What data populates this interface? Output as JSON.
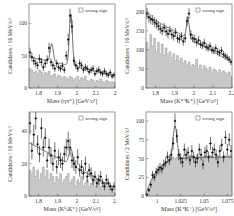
{
  "figure": {
    "legend_label": "wrong sign",
    "hist_color": "#c8c8c8",
    "hist_edge_color": "#8a8a8a",
    "point_color": "#111111",
    "fit_color": "#333333"
  },
  "chart_data": [
    {
      "type": "bar",
      "panel": "top-left",
      "title": "",
      "xlabel": "Mass (ηπ⁺)  [GeV/c²]",
      "ylabel": "Candidates / 10 MeV/c²",
      "xlim": [
        1.75,
        2.2
      ],
      "ylim": [
        0,
        130
      ],
      "xticks": [
        1.8,
        1.9,
        2.0,
        2.1,
        2.2
      ],
      "xtick_labels": [
        "1.8",
        "1.9",
        "2",
        "2.1",
        "2"
      ],
      "yticks": [
        0,
        50,
        100
      ],
      "legend": [
        "wrong sign"
      ],
      "legend_position": "upper right",
      "grid": false,
      "x": [
        1.755,
        1.765,
        1.775,
        1.785,
        1.795,
        1.805,
        1.815,
        1.825,
        1.835,
        1.845,
        1.855,
        1.865,
        1.875,
        1.885,
        1.895,
        1.905,
        1.915,
        1.925,
        1.935,
        1.945,
        1.955,
        1.965,
        1.975,
        1.985,
        1.995,
        2.005,
        2.015,
        2.025,
        2.035,
        2.045,
        2.055,
        2.065,
        2.075,
        2.085,
        2.095,
        2.105,
        2.115,
        2.125,
        2.135,
        2.145,
        2.155,
        2.165,
        2.175,
        2.185,
        2.195
      ],
      "series": [
        {
          "name": "data",
          "values": [
            55,
            48,
            42,
            38,
            35,
            45,
            40,
            32,
            38,
            44,
            62,
            40,
            35,
            30,
            38,
            32,
            30,
            34,
            28,
            50,
            75,
            112,
            95,
            42,
            35,
            30,
            38,
            35,
            28,
            32,
            30,
            25,
            28,
            30,
            22,
            26,
            28,
            24,
            22,
            26,
            22,
            20,
            24,
            18,
            20
          ]
        },
        {
          "name": "wrong sign",
          "values": [
            30,
            28,
            24,
            26,
            22,
            28,
            25,
            20,
            24,
            22,
            26,
            18,
            20,
            22,
            16,
            20,
            18,
            15,
            18,
            16,
            14,
            18,
            16,
            12,
            15,
            18,
            12,
            16,
            14,
            18,
            12,
            10,
            14,
            12,
            8,
            12,
            10,
            14,
            10,
            8,
            12,
            10,
            8,
            10,
            8
          ]
        }
      ],
      "fit": {
        "peaks": [
          {
            "x": 1.869,
            "height": 28,
            "sigma": 0.008
          },
          {
            "x": 1.969,
            "height": 80,
            "sigma": 0.008
          }
        ],
        "bg_start": 48,
        "bg_end": 20
      }
    },
    {
      "type": "bar",
      "panel": "top-right",
      "title": "",
      "xlabel": "Mass (K*⁰K⁺)  [GeV/c²]",
      "ylabel": "Candidates / 10 MeV/c²",
      "xlim": [
        1.75,
        2.2
      ],
      "ylim": [
        0,
        220
      ],
      "xticks": [
        1.8,
        1.9,
        2.0,
        2.1,
        2.2
      ],
      "xtick_labels": [
        "1.8",
        "1.9",
        "2",
        "2.1",
        "2.2"
      ],
      "yticks": [
        0,
        50,
        100,
        150,
        200
      ],
      "legend": [
        "wrong sign"
      ],
      "legend_position": "upper right",
      "grid": false,
      "x": [
        1.755,
        1.765,
        1.775,
        1.785,
        1.795,
        1.805,
        1.815,
        1.825,
        1.835,
        1.845,
        1.855,
        1.865,
        1.875,
        1.885,
        1.895,
        1.905,
        1.915,
        1.925,
        1.935,
        1.945,
        1.955,
        1.965,
        1.975,
        1.985,
        1.995,
        2.005,
        2.015,
        2.025,
        2.035,
        2.045,
        2.055,
        2.065,
        2.075,
        2.085,
        2.095,
        2.105,
        2.115,
        2.125,
        2.135,
        2.145,
        2.155,
        2.165,
        2.175,
        2.185,
        2.195
      ],
      "series": [
        {
          "name": "data",
          "values": [
            195,
            185,
            180,
            178,
            172,
            168,
            162,
            155,
            150,
            158,
            148,
            142,
            150,
            140,
            136,
            145,
            130,
            128,
            135,
            122,
            130,
            175,
            195,
            140,
            130,
            128,
            120,
            125,
            115,
            112,
            118,
            108,
            105,
            110,
            100,
            98,
            104,
            95,
            92,
            98,
            88,
            84,
            80,
            75,
            68
          ]
        },
        {
          "name": "wrong sign",
          "values": [
            120,
            100,
            140,
            110,
            130,
            95,
            120,
            90,
            115,
            85,
            105,
            88,
            95,
            80,
            90,
            72,
            85,
            70,
            78,
            65,
            72,
            60,
            68,
            55,
            62,
            58,
            75,
            50,
            60,
            48,
            58,
            52,
            45,
            55,
            42,
            50,
            46,
            40,
            48,
            38,
            45,
            40,
            35,
            42,
            30
          ]
        }
      ],
      "fit": {
        "peaks": [
          {
            "x": 1.969,
            "height": 55,
            "sigma": 0.007
          }
        ],
        "bg_start": 190,
        "bg_end": 68
      }
    },
    {
      "type": "bar",
      "panel": "bottom-left",
      "title": "",
      "xlabel": "Mass (K⁰ₛK⁺)  [GeV/c²]",
      "ylabel": "Candidates / 10 MeV/c²",
      "xlim": [
        1.75,
        2.2
      ],
      "ylim": [
        0,
        52
      ],
      "xticks": [
        1.8,
        1.9,
        2.0,
        2.1,
        2.2
      ],
      "xtick_labels": [
        "1.8",
        "1.9",
        "2",
        "2.1",
        "2."
      ],
      "yticks": [
        0,
        20,
        40
      ],
      "legend": [
        "wrong sign"
      ],
      "legend_position": "upper right",
      "grid": false,
      "x": [
        1.755,
        1.765,
        1.775,
        1.785,
        1.795,
        1.805,
        1.815,
        1.825,
        1.835,
        1.845,
        1.855,
        1.865,
        1.875,
        1.885,
        1.895,
        1.905,
        1.915,
        1.925,
        1.935,
        1.945,
        1.955,
        1.965,
        1.975,
        1.985,
        1.995,
        2.005,
        2.015,
        2.025,
        2.035,
        2.045,
        2.055,
        2.065,
        2.075,
        2.085,
        2.095,
        2.105,
        2.115,
        2.125,
        2.135,
        2.145,
        2.155,
        2.165,
        2.175,
        2.185,
        2.195
      ],
      "series": [
        {
          "name": "data",
          "values": [
            45,
            28,
            38,
            48,
            32,
            26,
            42,
            30,
            36,
            22,
            30,
            25,
            20,
            28,
            18,
            24,
            22,
            20,
            26,
            30,
            34,
            30,
            22,
            20,
            18,
            24,
            16,
            18,
            14,
            20,
            12,
            16,
            14,
            10,
            12,
            8,
            10,
            12,
            8,
            6,
            10,
            8,
            6,
            4,
            6
          ]
        },
        {
          "name": "wrong sign",
          "values": [
            16,
            14,
            18,
            12,
            16,
            10,
            14,
            18,
            12,
            16,
            10,
            14,
            12,
            8,
            12,
            10,
            14,
            8,
            10,
            12,
            14,
            8,
            10,
            12,
            6,
            10,
            8,
            12,
            6,
            8,
            10,
            6,
            8,
            10,
            6,
            8,
            10,
            6,
            4,
            8,
            6,
            4,
            6,
            4,
            2
          ]
        }
      ],
      "fit": {
        "peaks": [
          {
            "x": 1.969,
            "height": 10,
            "sigma": 0.01
          }
        ],
        "bg_start": 33,
        "bg_end": 5
      }
    },
    {
      "type": "bar",
      "panel": "bottom-right",
      "title": "",
      "xlabel": "Mass (K⁺K⁻)  [GeV/c²]",
      "ylabel": "Candidates / 2 MeV/c²",
      "xlim": [
        0.988,
        1.08
      ],
      "ylim": [
        0,
        112
      ],
      "xticks": [
        1.0,
        1.025,
        1.05,
        1.075
      ],
      "xtick_labels": [
        "1",
        "1.025",
        "1.05",
        "1.075"
      ],
      "yticks": [
        0,
        25,
        50,
        75,
        100
      ],
      "legend": [
        "wrong sign"
      ],
      "legend_position": "upper right",
      "grid": false,
      "x": [
        0.989,
        0.991,
        0.993,
        0.995,
        0.997,
        0.999,
        1.001,
        1.003,
        1.005,
        1.007,
        1.009,
        1.011,
        1.013,
        1.015,
        1.017,
        1.019,
        1.021,
        1.023,
        1.025,
        1.027,
        1.029,
        1.031,
        1.033,
        1.035,
        1.037,
        1.039,
        1.041,
        1.043,
        1.045,
        1.047,
        1.049,
        1.051,
        1.053,
        1.055,
        1.057,
        1.059,
        1.061,
        1.063,
        1.065,
        1.067,
        1.069,
        1.071,
        1.073,
        1.075,
        1.077,
        1.079
      ],
      "series": [
        {
          "name": "data",
          "values": [
            2,
            8,
            15,
            28,
            25,
            32,
            35,
            38,
            36,
            42,
            45,
            52,
            48,
            55,
            70,
            100,
            80,
            55,
            50,
            45,
            62,
            55,
            58,
            48,
            60,
            52,
            45,
            50,
            62,
            55,
            42,
            58,
            60,
            52,
            70,
            58,
            62,
            55,
            45,
            60,
            68,
            52,
            78,
            62,
            75,
            60
          ]
        },
        {
          "name": "wrong sign",
          "values": [
            2,
            6,
            12,
            22,
            26,
            30,
            32,
            36,
            38,
            42,
            44,
            46,
            48,
            50,
            52,
            50,
            52,
            54,
            52,
            50,
            54,
            52,
            50,
            52,
            54,
            52,
            50,
            54,
            52,
            50,
            52,
            54,
            52,
            50,
            54,
            52,
            50,
            52,
            54,
            52,
            50,
            52,
            54,
            52,
            54,
            52
          ]
        }
      ],
      "fit": {
        "peaks": [
          {
            "x": 1.019,
            "height": 45,
            "sigma": 0.0022
          }
        ],
        "threshold": 0.9874
      }
    }
  ]
}
